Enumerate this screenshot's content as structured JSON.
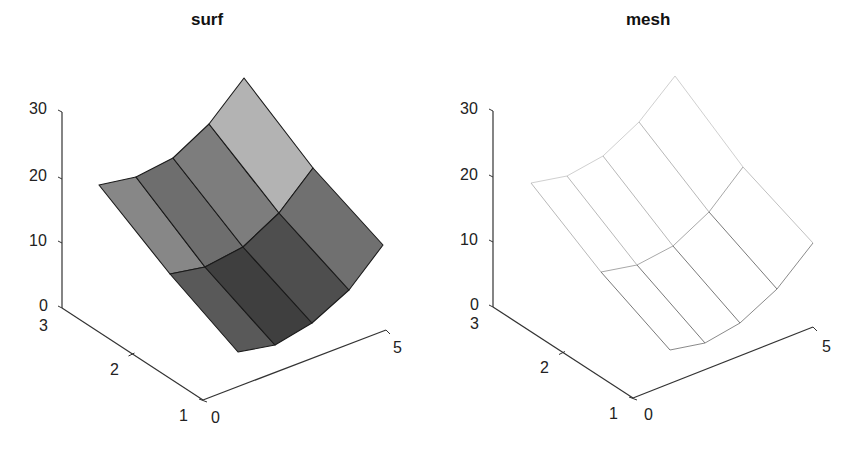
{
  "chart_data": [
    {
      "type": "surface",
      "title": "surf",
      "xlabel": "",
      "ylabel": "",
      "zlabel": "",
      "x_ticks": [
        "0",
        "5"
      ],
      "y_ticks": [
        "1",
        "2",
        "3"
      ],
      "z_ticks": [
        "0",
        "10",
        "20",
        "30"
      ],
      "xlim": [
        0,
        5
      ],
      "ylim": [
        1,
        3
      ],
      "zlim": [
        0,
        30
      ],
      "grid": false,
      "grid_size": {
        "rows": 3,
        "cols": 5
      },
      "projected_vertices": {
        "back": [
          [
            99,
            185
          ],
          [
            136,
            177
          ],
          [
            173,
            158
          ],
          [
            209,
            124
          ],
          [
            244,
            78
          ]
        ],
        "middle": [
          [
            170,
            274
          ],
          [
            205,
            267
          ],
          [
            243,
            247
          ],
          [
            279,
            213
          ],
          [
            313,
            168
          ]
        ],
        "front": [
          [
            238,
            352
          ],
          [
            275,
            345
          ],
          [
            312,
            323
          ],
          [
            349,
            290
          ],
          [
            383,
            245
          ]
        ]
      },
      "face_colors": {
        "back": [
          "#878787",
          "#6e6e6e",
          "#7d7d7d",
          "#b3b3b3"
        ],
        "front": [
          "#595959",
          "#3f3f3f",
          "#4e4e4e",
          "#707070"
        ]
      },
      "edge_color": "#1a1a1a"
    },
    {
      "type": "mesh",
      "title": "mesh",
      "xlabel": "",
      "ylabel": "",
      "zlabel": "",
      "x_ticks": [
        "0",
        "5"
      ],
      "y_ticks": [
        "1",
        "2",
        "3"
      ],
      "z_ticks": [
        "0",
        "10",
        "20",
        "30"
      ],
      "xlim": [
        0,
        5
      ],
      "ylim": [
        1,
        3
      ],
      "zlim": [
        0,
        30
      ],
      "grid": false,
      "grid_size": {
        "rows": 3,
        "cols": 5
      },
      "projected_vertices": {
        "back": [
          [
            531,
            183
          ],
          [
            567,
            176
          ],
          [
            603,
            156
          ],
          [
            639,
            122
          ],
          [
            675,
            76
          ]
        ],
        "middle": [
          [
            601,
            272
          ],
          [
            637,
            265
          ],
          [
            673,
            246
          ],
          [
            709,
            212
          ],
          [
            743,
            167
          ]
        ],
        "front": [
          [
            670,
            350
          ],
          [
            705,
            343
          ],
          [
            740,
            323
          ],
          [
            777,
            289
          ],
          [
            813,
            243
          ]
        ]
      },
      "line_colors": {
        "back": "#d0d0d0",
        "front": "#8a8a8a"
      }
    }
  ],
  "panels": {
    "surf": {
      "title": "surf",
      "z_tick_labels": [
        {
          "text": "30",
          "x": 29,
          "y": 101
        },
        {
          "text": "20",
          "x": 29,
          "y": 168
        },
        {
          "text": "10",
          "x": 29,
          "y": 233
        },
        {
          "text": "0",
          "x": 39,
          "y": 298
        }
      ],
      "y_tick_labels": [
        {
          "text": "3",
          "x": 39,
          "y": 318
        },
        {
          "text": "2",
          "x": 110,
          "y": 362
        },
        {
          "text": "1",
          "x": 179,
          "y": 408
        }
      ],
      "x_tick_labels": [
        {
          "text": "0",
          "x": 211,
          "y": 410
        },
        {
          "text": "5",
          "x": 393,
          "y": 340
        }
      ]
    },
    "mesh": {
      "title": "mesh",
      "z_tick_labels": [
        {
          "text": "30",
          "x": 460,
          "y": 101
        },
        {
          "text": "20",
          "x": 460,
          "y": 167
        },
        {
          "text": "10",
          "x": 460,
          "y": 232
        },
        {
          "text": "0",
          "x": 470,
          "y": 297
        }
      ],
      "y_tick_labels": [
        {
          "text": "3",
          "x": 470,
          "y": 316
        },
        {
          "text": "2",
          "x": 540,
          "y": 360
        },
        {
          "text": "1",
          "x": 609,
          "y": 406
        },
        {
          "text": "0",
          "x": 644,
          "y": 407
        }
      ],
      "x_tick_labels": [
        {
          "text": "5",
          "x": 822,
          "y": 339
        }
      ]
    }
  }
}
